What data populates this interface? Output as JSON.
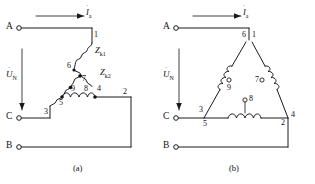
{
  "figure": {
    "background_color": "#ffffff",
    "line_color": "#1a1a1a"
  },
  "panels": [
    {
      "id": "a",
      "caption": "(a)",
      "terminals": [
        {
          "name": "A",
          "label": "A"
        },
        {
          "name": "C",
          "label": "C"
        },
        {
          "name": "B",
          "label": "B"
        }
      ],
      "current_label": {
        "symbol": "I",
        "subscript": "a",
        "dot": "˙"
      },
      "voltage_label": {
        "symbol": "U",
        "subscript": "N",
        "dot": "˙"
      },
      "impedances": [
        {
          "symbol": "Z",
          "subscript": "k1"
        },
        {
          "symbol": "Z",
          "subscript": "k2"
        }
      ],
      "nodes": [
        {
          "id": "1",
          "label": "1",
          "type": "plain"
        },
        {
          "id": "2",
          "label": "2",
          "type": "plain"
        },
        {
          "id": "3",
          "label": "3",
          "type": "plain"
        },
        {
          "id": "4",
          "label": "4",
          "type": "solid"
        },
        {
          "id": "5",
          "label": "5",
          "type": "solid"
        },
        {
          "id": "6",
          "label": "6",
          "type": "plain"
        },
        {
          "id": "7",
          "label": "7",
          "type": "solid"
        },
        {
          "id": "8",
          "label": "8",
          "type": "plain"
        },
        {
          "id": "9",
          "label": "9",
          "type": "plain"
        }
      ]
    },
    {
      "id": "b",
      "caption": "(b)",
      "terminals": [
        {
          "name": "A",
          "label": "A"
        },
        {
          "name": "C",
          "label": "C"
        },
        {
          "name": "B",
          "label": "B"
        }
      ],
      "current_label": {
        "symbol": "I",
        "subscript": "a",
        "dot": "˙"
      },
      "voltage_label": {
        "symbol": "U",
        "subscript": "N",
        "dot": "˙"
      },
      "nodes": [
        {
          "id": "1",
          "label": "1",
          "type": "plain"
        },
        {
          "id": "2",
          "label": "2",
          "type": "plain"
        },
        {
          "id": "3",
          "label": "3",
          "type": "plain"
        },
        {
          "id": "4",
          "label": "4",
          "type": "plain"
        },
        {
          "id": "5",
          "label": "5",
          "type": "plain"
        },
        {
          "id": "6",
          "label": "6",
          "type": "plain"
        },
        {
          "id": "7",
          "label": "7",
          "type": "open"
        },
        {
          "id": "8",
          "label": "8",
          "type": "open"
        },
        {
          "id": "9",
          "label": "9",
          "type": "open"
        }
      ]
    }
  ]
}
